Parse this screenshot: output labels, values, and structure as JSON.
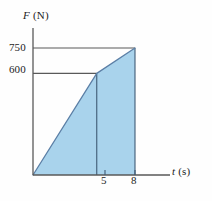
{
  "chart_data": {
    "type": "area",
    "title": "",
    "subtitle": "",
    "xlabel": "t (s)",
    "xlabel_symbol": "t",
    "xlabel_unit": "(s)",
    "ylabel": "F (N)",
    "ylabel_symbol": "F",
    "ylabel_unit": "(N)",
    "x": [
      0,
      5,
      8
    ],
    "values": [
      0,
      600,
      750
    ],
    "series": [
      {
        "name": "Force",
        "x": [
          0,
          5,
          8
        ],
        "values": [
          0,
          600,
          750
        ]
      }
    ],
    "xticks": [
      5,
      8
    ],
    "xtick_labels": [
      "5",
      "8"
    ],
    "yticks": [
      600,
      750
    ],
    "ytick_labels": [
      "600",
      "750"
    ],
    "xlim": [
      0,
      9.6
    ],
    "ylim": [
      0,
      845
    ],
    "grid": false,
    "gridlines_horizontal": [
      600,
      750
    ],
    "legend": null,
    "legend_position": "none",
    "annotations": [],
    "fill": true,
    "fill_color": "#a9d3ec",
    "line_color": "#5b7fa6",
    "axis_color": "#595959",
    "gridline_color": "#595959",
    "vertical_divider_x": 5,
    "background_color": "#fefefe",
    "text_color": "#1c1c1c"
  },
  "axes": {
    "y_axis_name": "force-axis",
    "x_axis_name": "time-axis"
  }
}
